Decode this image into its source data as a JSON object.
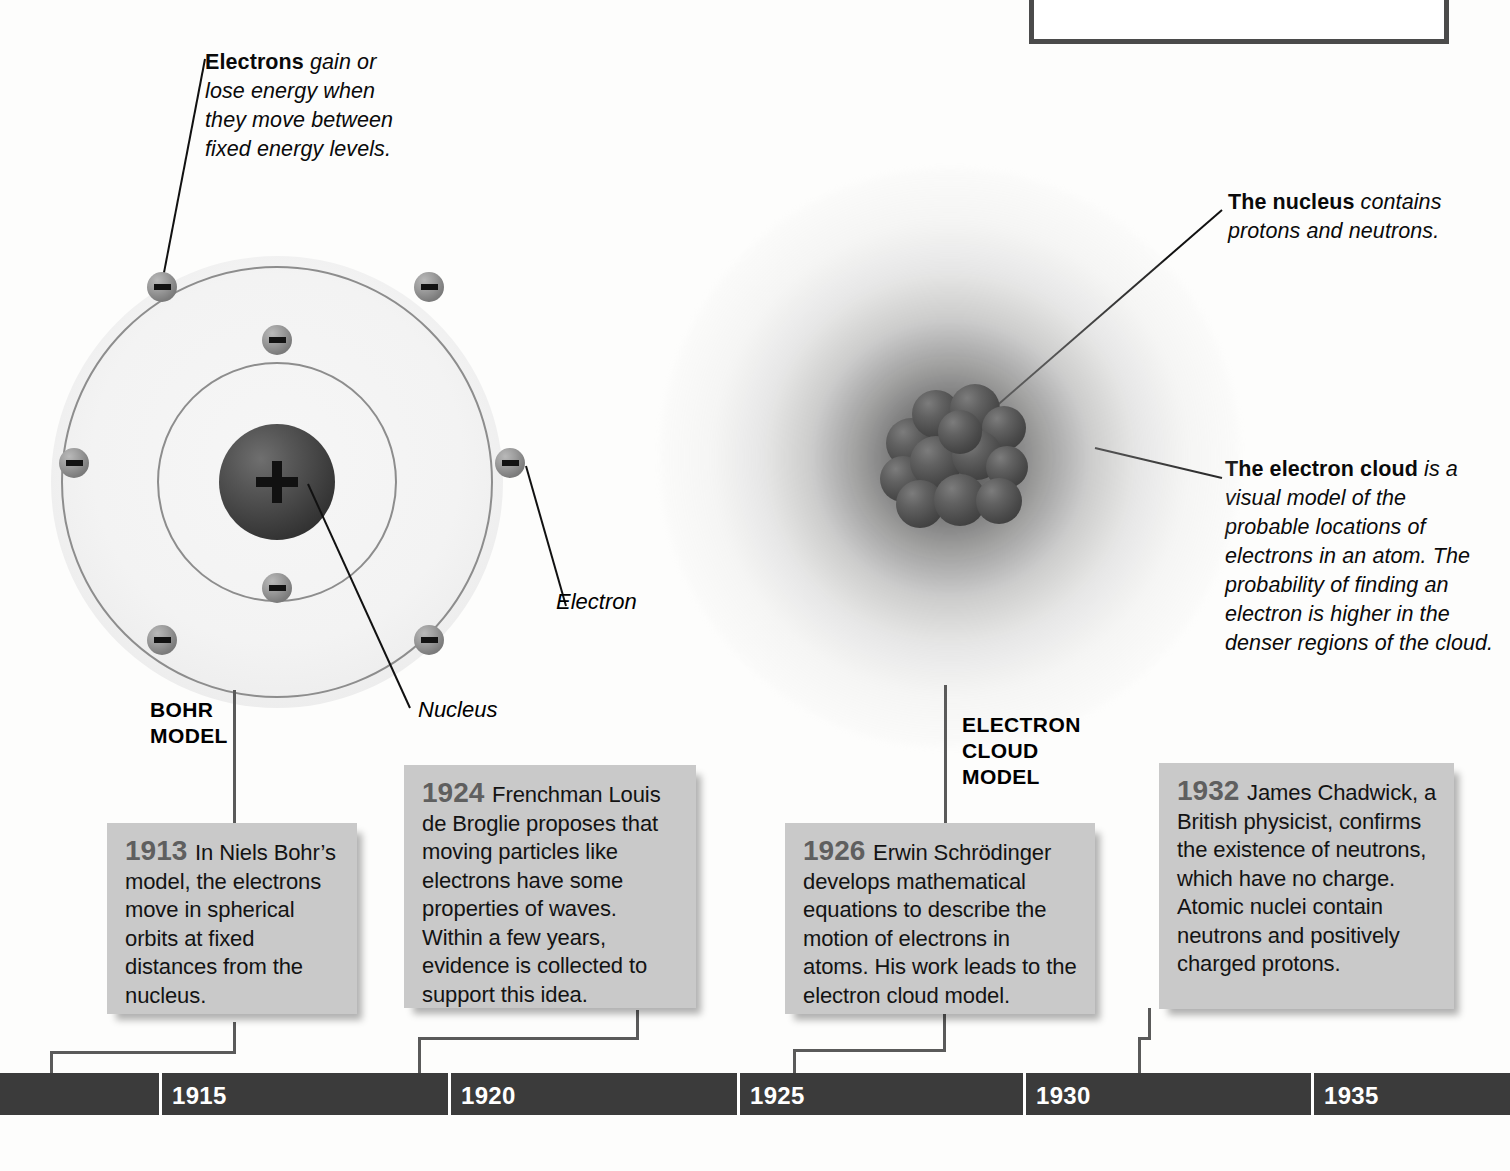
{
  "page": {
    "background_color": "#fdfdfc"
  },
  "callouts": [
    {
      "id": "electrons-energy",
      "lead": "Electrons",
      "rest": " gain or lose energy when they move between fixed energy levels."
    },
    {
      "id": "nucleus-callout",
      "lead": "The nucleus",
      "rest": " contains protons and neutrons."
    },
    {
      "id": "electron-cloud-callout",
      "lead": "The electron cloud",
      "rest": " is a visual model of the probable locations of electrons in an atom. The probability of finding an electron is higher in the denser regions of the cloud."
    }
  ],
  "bohr_model": {
    "name_line1": "BOHR",
    "name_line2": "MODEL",
    "nucleus_label": "Nucleus",
    "electron_label": "Electron",
    "nucleus_charge_symbol": "+",
    "electron_charge_symbol": "–",
    "inner_shell_electrons": 2,
    "outer_shell_electrons": 6
  },
  "electron_cloud_model": {
    "name_line1": "ELECTRON",
    "name_line2": "CLOUD",
    "name_line3": "MODEL"
  },
  "events": [
    {
      "year": "1913",
      "text": "In Niels Bohr’s model, the electrons move in spherical orbits at fixed distances from the nucleus."
    },
    {
      "year": "1924",
      "text": "Frenchman Louis de Broglie proposes that moving particles like electrons have some properties of waves. Within a few years, evidence is collected to support this idea."
    },
    {
      "year": "1926",
      "text": "Erwin Schrödinger develops mathematical equations to describe the motion of electrons in atoms. His work leads to the electron cloud model."
    },
    {
      "year": "1932",
      "text": "James Chadwick, a British physicist, confirms the existence of neutrons, which have no charge. Atomic nuclei contain neutrons and positively charged protons."
    }
  ],
  "timeline": {
    "bar_color": "#3b3b3b",
    "label_color": "#ffffff",
    "years": [
      "1915",
      "1920",
      "1925",
      "1930",
      "1935"
    ]
  },
  "colors": {
    "event_box_fill": "#c9c9c9",
    "event_year_text": "#5f5f5f",
    "body_text": "#131313",
    "orbit_stroke": "#8d8d8d",
    "nucleus_dark": "#3d3d3d",
    "electron_gray": "#9d9d9d",
    "connector": "#5a5a5a",
    "top_box_border": "#4b4b4b"
  }
}
